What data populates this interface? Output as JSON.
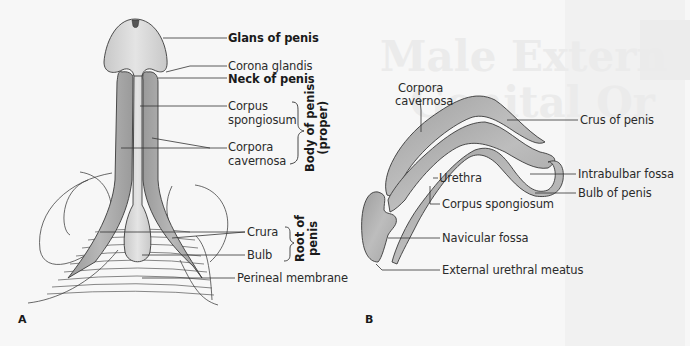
{
  "background": {
    "ghost_text_line1": "Male Extern",
    "ghost_text_line2": "Genital Or"
  },
  "panel_a": {
    "letter": "A",
    "labels": {
      "glans": "Glans of penis",
      "corona": "Corona glandis",
      "neck": "Neck of penis",
      "spongiosum_1": "Corpus",
      "spongiosum_2": "spongiosum",
      "cavernosa_1": "Corpora",
      "cavernosa_2": "cavernosa",
      "crura": "Crura",
      "bulb": "Bulb",
      "perineal": "Perineal membrane"
    },
    "groups": {
      "body_line1": "Body of penis",
      "body_line2": "(proper)",
      "root_line1": "Root of",
      "root_line2": "penis"
    }
  },
  "panel_b": {
    "letter": "B",
    "labels": {
      "cavernosa_1": "Corpora",
      "cavernosa_2": "cavernosa",
      "crus": "Crus of penis",
      "intrabulbar": "Intrabulbar fossa",
      "bulb": "Bulb of penis",
      "urethra": "Urethra",
      "spongiosum": "Corpus spongiosum",
      "navicular": "Navicular fossa",
      "meatus": "External urethral meatus"
    }
  },
  "colors": {
    "cavernosa": "#a9a9a9",
    "spongiosum": "#d4d4d4",
    "outline": "#3a3a3a",
    "tip": "#555555"
  }
}
